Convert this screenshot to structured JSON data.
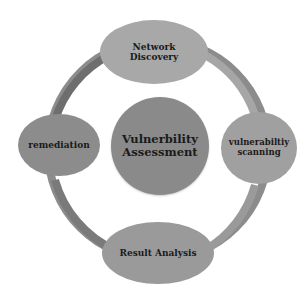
{
  "diagram": {
    "type": "cycle",
    "center": {
      "lines": [
        "Vulnerbility",
        "Assessment"
      ]
    },
    "nodes": [
      {
        "id": "top",
        "lines": [
          "Network",
          "Discovery"
        ]
      },
      {
        "id": "right",
        "lines": [
          "vulnerabiltiy",
          "scanning"
        ]
      },
      {
        "id": "bottom",
        "lines": [
          "Result Analysis"
        ]
      },
      {
        "id": "left",
        "lines": [
          "remediation"
        ]
      }
    ],
    "colors": {
      "ring": "#6e6e6e",
      "ring_light": "#9a9a9a",
      "center": "#8a8a8a",
      "node": "#a0a0a0",
      "text": "#1a1a1a"
    }
  }
}
